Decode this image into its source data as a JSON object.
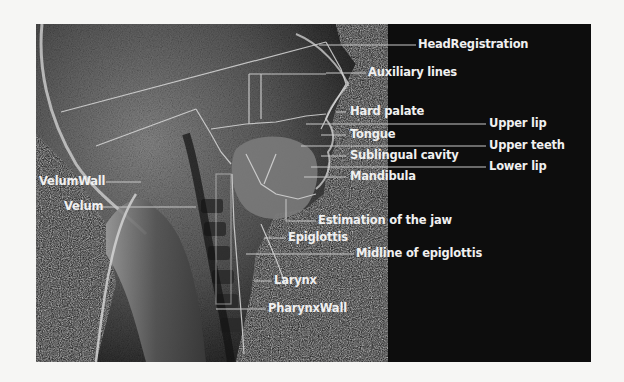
{
  "figure": {
    "labels": {
      "head_registration": "HeadRegistration",
      "auxiliary_lines": "Auxiliary lines",
      "hard_palate": "Hard palate",
      "upper_lip": "Upper lip",
      "tongue": "Tongue",
      "upper_teeth": "Upper teeth",
      "sublingual_cavity": "Sublingual cavity",
      "lower_lip": "Lower lip",
      "mandibula": "Mandibula",
      "velum_wall": "VelumWall",
      "velum": "Velum",
      "estimation_of_the_jaw": "Estimation of the jaw",
      "epiglottis": "Epiglottis",
      "midline_of_epiglottis": "Midline of epiglottis",
      "larynx": "Larynx",
      "pharynx_wall": "PharynxWall"
    },
    "colors": {
      "panel_bg": "#0d0d0d",
      "label_text": "#f0f0f0",
      "leader_line": "#bfbfbf",
      "page_bg": "#f6f6f4"
    }
  }
}
